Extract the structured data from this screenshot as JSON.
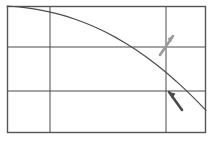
{
  "chart_data": {
    "type": "line",
    "title": "",
    "subtitle": "",
    "xlabel": "",
    "ylabel": "",
    "legend": [],
    "annotations_text": [],
    "tick_labels": {
      "x": [],
      "y": []
    },
    "grid": true,
    "grid_x_positions": [
      50,
      166
    ],
    "grid_y_positions": [
      47,
      91
    ],
    "xlim": [
      0,
      100
    ],
    "ylim": [
      0,
      100
    ],
    "x": [
      0,
      5,
      10,
      15,
      20,
      25,
      30,
      35,
      40,
      45,
      50,
      55,
      60,
      65,
      70,
      75,
      80,
      85,
      90,
      95,
      100
    ],
    "series": [
      {
        "name": "curve",
        "color": "#4d4d4d",
        "values": [
          100,
          99.4,
          98.5,
          97.3,
          95.8,
          94.0,
          91.8,
          89.2,
          86.2,
          82.9,
          79.1,
          74.9,
          70.3,
          65.3,
          59.8,
          53.9,
          47.6,
          40.8,
          33.6,
          25.9,
          17.8
        ]
      }
    ]
  },
  "frame": {
    "border_color": "#555555",
    "grid_color": "#4a4a4a",
    "background": "#ffffff",
    "left": 7,
    "top": 6,
    "right": 206,
    "bottom": 133
  },
  "markers": [
    {
      "name": "annotation-arrow-up-right",
      "color": "#9a9a9a",
      "direction": "up-right",
      "x": 168,
      "y": 45
    },
    {
      "name": "annotation-arrow-down-right",
      "color": "#4a4a4a",
      "direction": "down-right",
      "x": 176,
      "y": 100
    }
  ]
}
